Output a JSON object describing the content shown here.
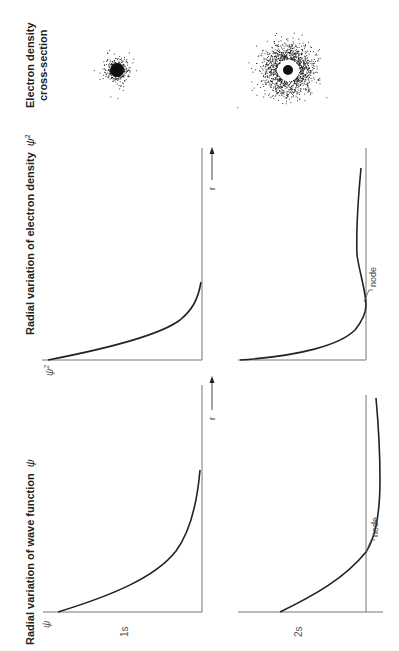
{
  "headers": {
    "wave_function": "Radial variation of wave function",
    "wave_function_symbol": "ψ",
    "electron_density": "Radial variation of electron density",
    "electron_density_symbol": "ψ",
    "electron_density_exponent": "2",
    "cross_section_line1": "Electron density",
    "cross_section_line2": "cross-section"
  },
  "rows": [
    {
      "label": "1s"
    },
    {
      "label": "2s"
    }
  ],
  "axes": {
    "psi_label": "ψ",
    "psi2_label": "ψ",
    "psi2_exp": "2",
    "r_label": "r"
  },
  "annotations": {
    "node_psi": "node",
    "node_psi2": "node"
  },
  "colors": {
    "curve": "#222222",
    "axis": "#777777",
    "dots": "#111111"
  }
}
